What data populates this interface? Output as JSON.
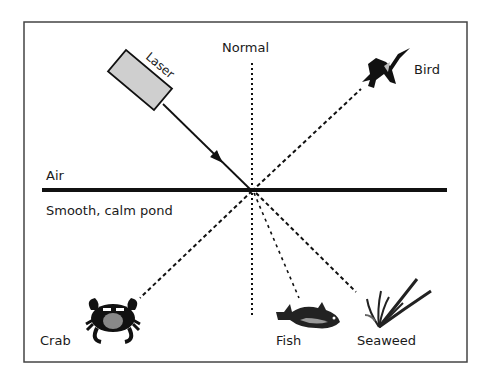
{
  "diagram": {
    "type": "light reflection and refraction at water surface",
    "labels": {
      "normal": "Normal",
      "laser": "Laser",
      "bird": "Bird",
      "air": "Air",
      "pond": "Smooth, calm pond",
      "crab": "Crab",
      "fish": "Fish",
      "seaweed": "Seaweed"
    },
    "colors": {
      "stroke": "#111111",
      "frame": "#444444",
      "laser_fill": "#cfcfcf",
      "background": "#ffffff"
    },
    "incidence_point": {
      "x": 252,
      "y": 191
    },
    "rays": [
      {
        "name": "incident-ray",
        "from": "Laser",
        "style": "solid-arrow"
      },
      {
        "name": "reflected-ray",
        "to": "Bird",
        "style": "dashed"
      },
      {
        "name": "ray-to-crab",
        "to": "Crab",
        "style": "dashed"
      },
      {
        "name": "ray-to-fish",
        "to": "Fish",
        "style": "dashed"
      },
      {
        "name": "ray-to-seaweed",
        "to": "Seaweed",
        "style": "dashed"
      },
      {
        "name": "normal-line",
        "to": "Normal",
        "style": "dotted"
      }
    ]
  }
}
